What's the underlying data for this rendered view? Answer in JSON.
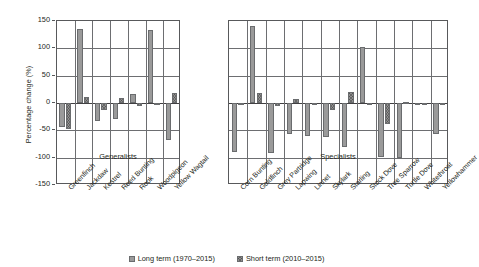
{
  "chart_data": {
    "type": "bar",
    "title": "",
    "xlabel": "",
    "ylabel": "Percentage change (%)",
    "ylim": [
      -150,
      150
    ],
    "yticks": [
      150,
      100,
      50,
      0,
      -50,
      -100,
      -150
    ],
    "ytick_labels": [
      "150",
      "100",
      "50",
      "0",
      "-50",
      "-100",
      "-150"
    ],
    "grid": true,
    "legend_position": "bottom-center",
    "legend": [
      "Long term (1970–2015)",
      "Short term (2010–2015)"
    ],
    "series": [
      {
        "name": "Long term (1970–2015)",
        "key": "long",
        "color": "#9a9a9a"
      },
      {
        "name": "Short term (2010–2015)",
        "key": "short",
        "color": "#8f8f8f"
      }
    ],
    "panels": [
      {
        "caption": "Generalists",
        "categories": [
          "Greenfinch",
          "Jackdaw",
          "Kestrel",
          "Reed Bunting",
          "Rook",
          "Woodpigeon",
          "Yellow Wagtail"
        ],
        "long": [
          -44,
          135,
          -33,
          -29,
          16,
          134,
          -67
        ],
        "short": [
          -47,
          11,
          -13,
          9,
          -5,
          -4,
          18
        ]
      },
      {
        "caption": "Specialists",
        "categories": [
          "Corn Bunting",
          "Goldfinch",
          "Grey Partridge",
          "Lapwing",
          "Linnet",
          "Skylark",
          "Starling",
          "Stock Dove",
          "Tree Sparrow",
          "Turtle Dove",
          "Whitethroat",
          "Yellowhammer"
        ],
        "long": [
          -90,
          141,
          -92,
          -57,
          -61,
          -63,
          -80,
          102,
          -99,
          -100,
          -3,
          -56
        ],
        "short": [
          -2,
          18,
          -5,
          7,
          -3,
          -12,
          20,
          -1,
          -38,
          2,
          -1,
          -1
        ]
      }
    ]
  }
}
